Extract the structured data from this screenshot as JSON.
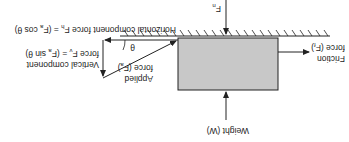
{
  "diagram": {
    "orientation": "rotated-180",
    "colors": {
      "box": "#c8c8c8",
      "stroke": "#222222",
      "background": "#ffffff"
    },
    "labels": {
      "normal_force": "F",
      "normal_force_sub": "n",
      "friction_line1": "Friction",
      "friction_line2": "force (F",
      "friction_sub": "f",
      "friction_close": ")",
      "weight": "Weight (W)",
      "applied_line1": "Applied",
      "applied_line2": "force (F",
      "applied_sub": "a",
      "applied_close": ")",
      "theta": "θ",
      "horizontal": "Horizontal component force F",
      "horizontal_sub": "h",
      "horizontal_eq": " = (F",
      "horizontal_eq_sub": "a",
      "horizontal_eq_end": " cos θ)",
      "vertical_line1": "Vertical component",
      "vertical_line2": "force F",
      "vertical_sub": "v",
      "vertical_eq": " = (F",
      "vertical_eq_sub": "a",
      "vertical_eq_end": " sin θ)"
    }
  }
}
